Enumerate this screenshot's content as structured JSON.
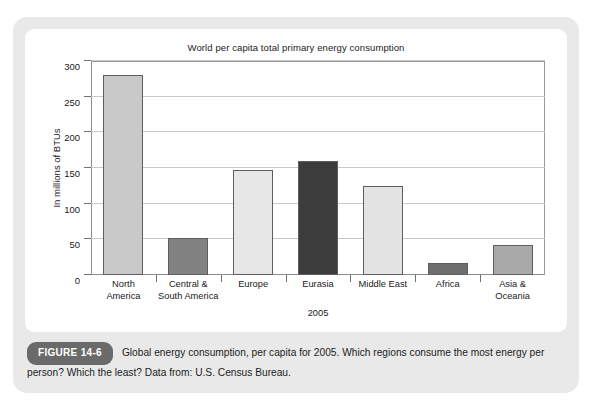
{
  "figure": {
    "badge_label": "FIGURE 14-6",
    "caption": "Global energy consumption, per capita for 2005. Which regions consume the most energy per person? Which the least? Data from: U.S. Census Bureau."
  },
  "chart_data": {
    "type": "bar",
    "title": "World per capita total primary energy consumption",
    "xlabel": "2005",
    "ylabel": "In millions of BTUs",
    "ylim": [
      0,
      300
    ],
    "yticks": [
      0,
      50,
      100,
      150,
      200,
      250,
      300
    ],
    "grid": true,
    "legend": null,
    "categories": [
      "North\nAmerica",
      "Central &\nSouth America",
      "Europe",
      "Eurasia",
      "Middle East",
      "Africa",
      "Asia &\nOceania"
    ],
    "category_lines": [
      [
        "North",
        "America"
      ],
      [
        "Central &",
        "South America"
      ],
      [
        "Europe",
        ""
      ],
      [
        "Eurasia",
        ""
      ],
      [
        "Middle East",
        ""
      ],
      [
        "Africa",
        ""
      ],
      [
        "Asia &",
        "Oceania"
      ]
    ],
    "values": [
      281,
      52,
      147,
      160,
      125,
      17,
      42
    ],
    "bar_colors": [
      "#c9c9c9",
      "#828282",
      "#e7e7e7",
      "#3c3c3c",
      "#e3e3e3",
      "#6e6e6e",
      "#a9a9a9"
    ]
  },
  "colors": {
    "page_background": "#ffffff",
    "card_background": "#e9e9e9",
    "panel_background": "#ffffff",
    "badge_background": "#6a6a6a",
    "axis": "#8d8d8d",
    "gridline": "#c9c9c9",
    "text": "#1a1a1a"
  }
}
